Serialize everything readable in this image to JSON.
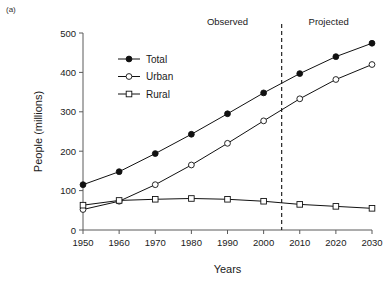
{
  "panel": {
    "label": "(a)"
  },
  "chart_data": {
    "type": "line",
    "title": "",
    "xlabel": "Years",
    "ylabel": "People (millions)",
    "x": [
      1950,
      1960,
      1970,
      1980,
      1990,
      2000,
      2010,
      2020,
      2030
    ],
    "xtick_labels": [
      "1950",
      "1960",
      "1970",
      "1980",
      "1990",
      "2000",
      "2010",
      "2020",
      "2030"
    ],
    "ytick_labels": [
      "0",
      "100",
      "200",
      "300",
      "400",
      "500"
    ],
    "yticks": [
      0,
      100,
      200,
      300,
      400,
      500
    ],
    "xlim": [
      1950,
      2030
    ],
    "ylim": [
      0,
      500
    ],
    "grid": false,
    "legend_position": "upper-left-inside",
    "series": [
      {
        "name": "Total",
        "marker": "filled-circle",
        "values": [
          115,
          148,
          194,
          243,
          295,
          348,
          397,
          440,
          474
        ]
      },
      {
        "name": "Urban",
        "marker": "open-circle",
        "values": [
          52,
          73,
          115,
          165,
          220,
          277,
          333,
          382,
          420
        ]
      },
      {
        "name": "Rural",
        "marker": "open-square",
        "values": [
          63,
          75,
          78,
          80,
          78,
          73,
          65,
          60,
          55
        ]
      }
    ],
    "annotations": [
      {
        "text": "Observed",
        "x": 1990
      },
      {
        "text": "Projected",
        "x": 2018
      }
    ],
    "divider": {
      "x": 2005,
      "style": "dashed"
    },
    "colors": {
      "line": "#111111",
      "axis": "#5a5a5a",
      "text": "#1a1a1a"
    }
  }
}
